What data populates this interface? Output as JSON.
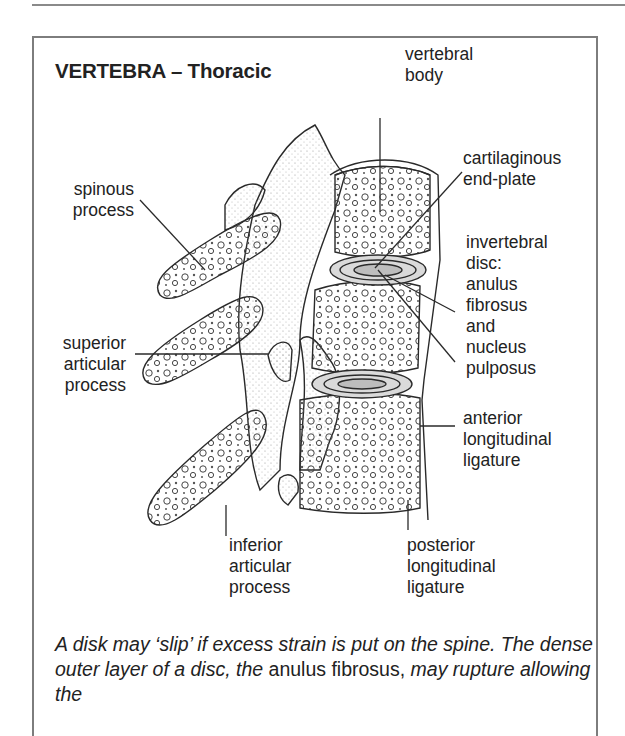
{
  "title": "VERTEBRA – Thoracic",
  "labels": {
    "vertebral_body": [
      "vertebral",
      "body"
    ],
    "cartilaginous_end_plate": [
      "cartilaginous",
      "end-plate"
    ],
    "spinous_process": [
      "spinous",
      "process"
    ],
    "intervertebral_disc": [
      "invertebral",
      "disc:",
      "anulus",
      "fibrosus",
      "and",
      "nucleus",
      "pulposus"
    ],
    "superior_articular_process": [
      "superior",
      "articular",
      "process"
    ],
    "anterior_longitudinal_ligature": [
      "anterior",
      "longitudinal",
      "ligature"
    ],
    "inferior_articular_process": [
      "inferior",
      "articular",
      "process"
    ],
    "posterior_longitudinal_ligature": [
      "posterior",
      "longitudinal",
      "ligature"
    ]
  },
  "caption": {
    "part1": "A disk may ‘slip’ if excess strain is put on the spine. The dense outer layer of a disc, the",
    "part2": "anulus fibrosus,",
    "part3": "may rupture allowing the"
  },
  "colors": {
    "ink": "#222222",
    "border": "#7d7d7d",
    "disc_fill": "#c8c8c8",
    "stipple": "#9a9a9a"
  }
}
